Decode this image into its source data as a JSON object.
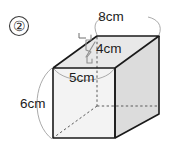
{
  "figure": {
    "item_number": "②",
    "shape": "rectangular-prism",
    "labels": {
      "width": {
        "value": "8",
        "unit": "cm",
        "text": "8cm",
        "edge": "top-back-horizontal"
      },
      "depth": {
        "value": "4",
        "unit": "cm",
        "text": "4cm",
        "edge": "top-depth"
      },
      "front_width": {
        "value": "5",
        "unit": "cm",
        "text": "5cm",
        "edge": "front-top-horizontal"
      },
      "height": {
        "value": "6",
        "unit": "cm",
        "text": "6cm",
        "edge": "left-vertical"
      }
    },
    "colors": {
      "front_face": "#f2f2f2",
      "top_face": "#e6e6e6",
      "right_face": "#dcdcdc",
      "left_face": "#ebebeb",
      "outline": "#1a1a1a",
      "hidden_edge": "#555555",
      "leader": "#9a9a9a",
      "text": "#1c1c1c",
      "background": "#ffffff"
    }
  }
}
